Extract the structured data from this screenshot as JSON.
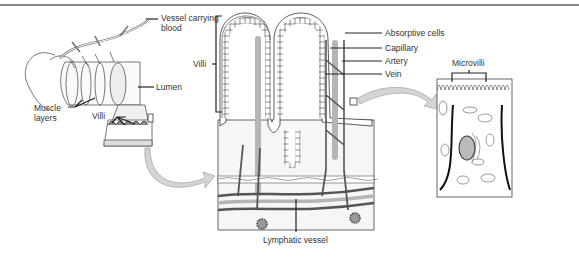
{
  "diagram": {
    "topic": "Small intestine villi structure",
    "panels": [
      {
        "id": "intestine",
        "labels": [
          "Vessel carrying blood",
          "Lumen",
          "Muscle layers",
          "Villi"
        ]
      },
      {
        "id": "villus-cross-section",
        "labels": [
          "Villi",
          "Absorptive cells",
          "Capillary",
          "Artery",
          "Vein",
          "Lymphatic vessel"
        ]
      },
      {
        "id": "absorptive-cell",
        "labels": [
          "Microvilli"
        ]
      }
    ]
  },
  "labels": {
    "vessel_line1": "Vessel carrying",
    "vessel_line2": "blood",
    "lumen": "Lumen",
    "muscle_line1": "Muscle",
    "muscle_line2": "layers",
    "villi_left": "Villi",
    "villi_center": "Villi",
    "absorptive": "Absorptive cells",
    "capillary": "Capillary",
    "artery": "Artery",
    "vein": "Vein",
    "lymphatic": "Lymphatic vessel",
    "microvilli": "Microvilli"
  },
  "colors": {
    "line": "#333333",
    "vessel_dark": "#555555",
    "vessel_light": "#b5b5b5",
    "arrow": "#d4d4d4",
    "tissue": "#f4f4f4"
  }
}
